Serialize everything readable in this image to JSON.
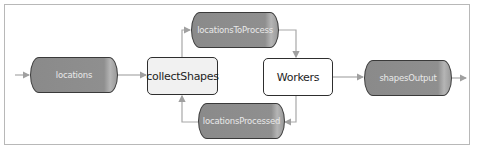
{
  "diagram": {
    "nodes": {
      "locations": {
        "label": "locations",
        "shape": "cylinder"
      },
      "collectShapes": {
        "label": "collectShapes",
        "shape": "process"
      },
      "locationsToProcess": {
        "label": "locationsToProcess",
        "shape": "cylinder"
      },
      "locationsProcessed": {
        "label": "locationsProcessed",
        "shape": "cylinder"
      },
      "workers": {
        "label": "Workers",
        "shape": "process"
      },
      "shapesOutput": {
        "label": "shapesOutput",
        "shape": "cylinder"
      }
    },
    "edges": [
      {
        "from": "input",
        "to": "locations"
      },
      {
        "from": "locations",
        "to": "collectShapes"
      },
      {
        "from": "collectShapes",
        "to": "locationsToProcess"
      },
      {
        "from": "locationsToProcess",
        "to": "workers"
      },
      {
        "from": "workers",
        "to": "locationsProcessed"
      },
      {
        "from": "locationsProcessed",
        "to": "collectShapes"
      },
      {
        "from": "workers",
        "to": "shapesOutput"
      },
      {
        "from": "shapesOutput",
        "to": "output"
      }
    ],
    "colors": {
      "cylinder_fill": "#8f8f8f",
      "cylinder_text": "#e9e9e9",
      "collect_fill": "#f1f1f1",
      "workers_fill": "#ffffff",
      "edge": "#a8a8a8"
    }
  }
}
